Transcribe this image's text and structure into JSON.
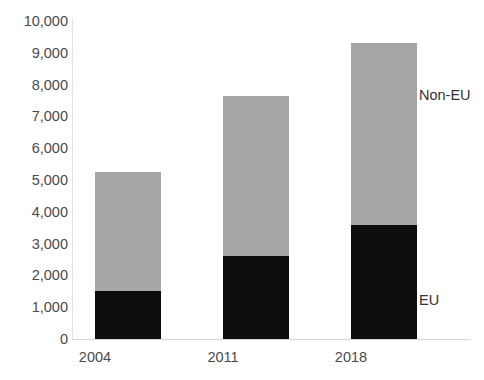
{
  "chart_data": {
    "type": "bar",
    "subtype": "stacked-column",
    "title": "",
    "xlabel": "",
    "ylabel": "",
    "categories": [
      "2004",
      "2011",
      "2018"
    ],
    "series": [
      {
        "name": "EU",
        "color": "#0d0d0d",
        "values": [
          1500,
          2600,
          3600
        ]
      },
      {
        "name": "Non-EU",
        "color": "#a6a6a6",
        "values": [
          3750,
          5050,
          5700
        ]
      }
    ],
    "totals": [
      5250,
      7650,
      9300
    ],
    "ylim": [
      0,
      10000
    ],
    "ytick_step": 1000,
    "ytick_labels": [
      "10,000",
      "9,000",
      "8,000",
      "7,000",
      "6,000",
      "5,000",
      "4,000",
      "3,000",
      "2,000",
      "1,000",
      "0"
    ],
    "ytick_values": [
      10000,
      9000,
      8000,
      7000,
      6000,
      5000,
      4000,
      3000,
      2000,
      1000,
      0
    ],
    "grid": false,
    "legend": "inline-right",
    "legend_entries": [
      {
        "label": "Non-EU",
        "color": "#a6a6a6"
      },
      {
        "label": "EU",
        "color": "#0d0d0d"
      }
    ]
  },
  "axis": {
    "y_labels": [
      "10,000",
      "9,000",
      "8,000",
      "7,000",
      "6,000",
      "5,000",
      "4,000",
      "3,000",
      "2,000",
      "1,000",
      "0"
    ],
    "x_labels": [
      "2004",
      "2011",
      "2018"
    ]
  },
  "labels": {
    "non_eu": "Non-EU",
    "eu": "EU"
  }
}
